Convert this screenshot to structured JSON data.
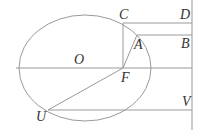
{
  "diagram": {
    "labels": {
      "C": "C",
      "D": "D",
      "A": "A",
      "B": "B",
      "O": "O",
      "F": "F",
      "U": "U",
      "V": "V"
    },
    "ellipse": {
      "cx": 85,
      "cy": 68,
      "rx": 66,
      "ry": 53
    },
    "points": {
      "C": [
        123,
        23
      ],
      "A": [
        137,
        35
      ],
      "F": [
        123,
        68
      ],
      "U": [
        48,
        110
      ],
      "directrix_x": 192
    }
  }
}
